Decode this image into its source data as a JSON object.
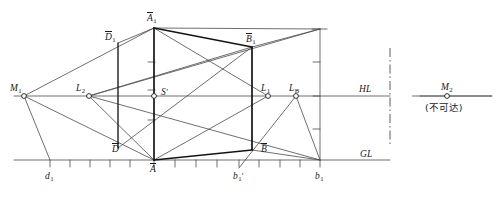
{
  "figure": {
    "type": "perspective-construction-diagram",
    "title_visible": false,
    "colors": {
      "line": "#4a4a4a",
      "heavy_line": "#141414",
      "text": "#1a1a1a",
      "background": "#ffffff"
    },
    "reference_lines": {
      "horizon": {
        "label": "HL",
        "y": 96
      },
      "ground": {
        "label": "GL",
        "y": 160
      }
    },
    "break_line": {
      "style": "dash-dot",
      "x": 390
    },
    "note": {
      "text": "(不可达)"
    },
    "labels": {
      "m1": "M",
      "m1_sub": "1",
      "m2": "M",
      "m2_sub": "2",
      "l2": "L",
      "l2_sub": "2",
      "l1": "L",
      "l1_sub": "1",
      "lb": "L",
      "lb_sub": "B",
      "s_prime": "S",
      "s_prime_mark": "'",
      "a_bar_1": "A",
      "a_bar_1_sub": "1",
      "b_bar_1": "B",
      "b_bar_1_sub": "1",
      "d_bar_1": "D",
      "d_bar_1_sub": "1",
      "a_bar": "A",
      "b_bar": "B",
      "d_bar": "D",
      "d1": "d",
      "d1_sub": "1",
      "b1_prime": "b",
      "b1_prime_sub": "1",
      "b1_prime_mark": "'",
      "b1": "b",
      "b1_sub": "1",
      "hl": "HL",
      "gl": "GL"
    },
    "points": [
      {
        "name": "M1",
        "x": 24,
        "y": 96,
        "marker": "circle"
      },
      {
        "name": "L2",
        "x": 89,
        "y": 96,
        "marker": "circle"
      },
      {
        "name": "S'",
        "x": 154,
        "y": 96,
        "marker": "circle"
      },
      {
        "name": "L1",
        "x": 268,
        "y": 96,
        "marker": "circle"
      },
      {
        "name": "LB",
        "x": 296,
        "y": 96,
        "marker": "circle"
      },
      {
        "name": "M2",
        "x": 447,
        "y": 96,
        "marker": "circle"
      },
      {
        "name": "A_bar",
        "x": 154,
        "y": 160,
        "marker": "none"
      },
      {
        "name": "A_bar_1",
        "x": 154,
        "y": 28,
        "marker": "none"
      },
      {
        "name": "B_bar",
        "x": 252,
        "y": 150,
        "marker": "none"
      },
      {
        "name": "B_bar_1",
        "x": 252,
        "y": 47,
        "marker": "none"
      },
      {
        "name": "D_bar",
        "x": 118,
        "y": 148,
        "marker": "none"
      },
      {
        "name": "D_bar_1",
        "x": 118,
        "y": 43,
        "marker": "none"
      },
      {
        "name": "d1_tick",
        "x": 50,
        "y": 160,
        "marker": "none"
      },
      {
        "name": "b1_prime_tick",
        "x": 239,
        "y": 160,
        "marker": "none"
      },
      {
        "name": "b1_tick",
        "x": 320,
        "y": 160,
        "marker": "none"
      }
    ],
    "gl_ticks_x": [
      50,
      70,
      90,
      110,
      130,
      154,
      175,
      196,
      217,
      239,
      259,
      280,
      300,
      320
    ],
    "scale_bar": {
      "x": 320,
      "top": 29,
      "bottom": 160,
      "tick_y": [
        29,
        62,
        96,
        129,
        160
      ]
    },
    "center_scale_ticks": {
      "x": 154,
      "tick_y": [
        62,
        96,
        129
      ],
      "length": 7
    }
  }
}
